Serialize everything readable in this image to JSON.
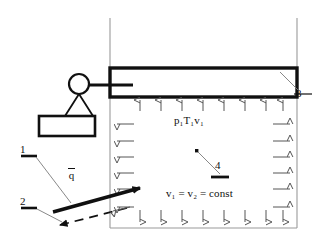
{
  "figure": {
    "type": "engineering-schematic"
  },
  "labels": {
    "state_props": "p₁T₁v₁",
    "volume_relation": "v₁ = v₂ = const",
    "heat_flux": "q",
    "callout_1": "1",
    "callout_2": "2",
    "callout_3": "3",
    "callout_4": "4"
  },
  "callouts": [
    {
      "id": "1",
      "text": "1",
      "target": "heat-flux-arrow-tail"
    },
    {
      "id": "2",
      "text": "2",
      "target": "dashed-return-arrow"
    },
    {
      "id": "3",
      "text": "3",
      "target": "piston-body"
    },
    {
      "id": "4",
      "text": "4",
      "target": "gas-point-marker"
    }
  ],
  "components": {
    "cylinder_wall": "cylinder-wall",
    "piston": "piston-block",
    "piston_rod": "piston-rod",
    "pulley": "pulley-circle",
    "hanger": "weight-hanger",
    "weight": "weight-block",
    "gas_region": "gas-chamber",
    "heat_arrow": "heat-flux-arrow",
    "dashed_arrow": "dashed-return-arrow",
    "point_marker": "gas-point-marker"
  },
  "arrow_fields": {
    "top_up": {
      "count": 8,
      "direction": "up",
      "name": "pressure-arrows-top"
    },
    "left": {
      "count": 6,
      "direction": "left",
      "name": "pressure-arrows-left"
    },
    "right": {
      "count": 6,
      "direction": "right",
      "name": "pressure-arrows-right"
    },
    "bottom_down": {
      "count": 8,
      "direction": "down",
      "name": "pressure-arrows-bottom"
    }
  },
  "colors": {
    "ink": "#101010",
    "wall": "#9a9a9a",
    "arrow": "#555555",
    "leader": "#7a7a7a",
    "background": "#ffffff"
  }
}
